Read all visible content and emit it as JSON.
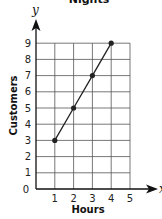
{
  "chart_data": {
    "type": "line",
    "title": "Nights",
    "xlabel": "Hours",
    "ylabel": "Customers",
    "x_axis_symbol": "x",
    "y_axis_symbol": "y",
    "x": [
      1,
      2,
      3,
      4
    ],
    "series": [
      {
        "name": "Customers",
        "values": [
          3,
          5,
          7,
          9
        ]
      }
    ],
    "xticks": [
      "0",
      "1",
      "2",
      "3",
      "4",
      "5"
    ],
    "yticks": [
      "1",
      "2",
      "3",
      "4",
      "5",
      "6",
      "7",
      "8",
      "9"
    ],
    "xlim": [
      0,
      5
    ],
    "ylim": [
      0,
      9
    ],
    "grid": true,
    "markers": true,
    "colors": {
      "line": "#222222",
      "grid": "#555555",
      "axis": "#111111"
    }
  }
}
